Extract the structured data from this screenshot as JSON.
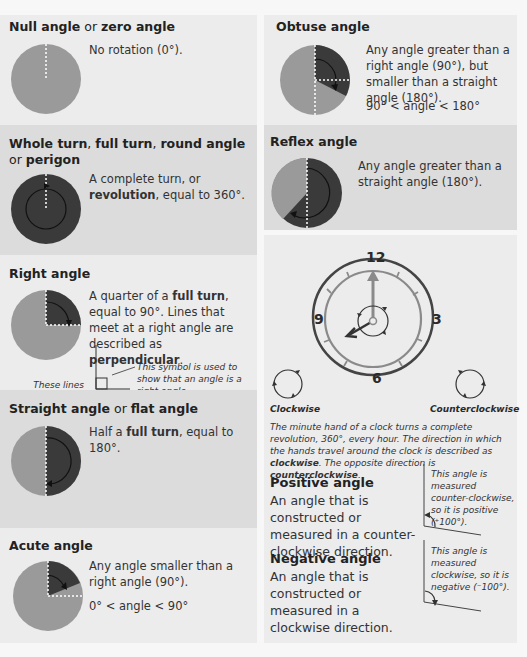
{
  "colors": {
    "light_panel": "#ececec",
    "dark_panel": "#dcdcdc",
    "pie_light": "#9a9a9a",
    "pie_dark": "#3a3a3a",
    "clock_outer": "#444444",
    "clock_inner": "#8a8a8a"
  },
  "null_angle": {
    "title_a": "Null angle",
    "title_or": " or ",
    "title_b": "zero angle",
    "desc": "No rotation (0°).",
    "icon": "null-angle-pie"
  },
  "whole_turn": {
    "title_a": "Whole turn",
    "sep1": ", ",
    "title_b": "full turn",
    "sep2": ", ",
    "title_c": "round angle",
    "title_or": "or ",
    "title_d": "perigon",
    "desc_1": "A complete turn, or",
    "desc_bold": "revolution",
    "desc_2": ", equal to 360°.",
    "icon": "whole-turn-pie"
  },
  "right_angle": {
    "title": "Right angle",
    "desc_1": "A quarter of a ",
    "desc_bold1": "full turn",
    "desc_2": ", equal to 90°. Lines that meet at a right angle are described as ",
    "desc_bold2": "perpendicular",
    "desc_3": ".",
    "note_left": "These lines are perpendicular.",
    "note_right": "This symbol is used to show that an angle is a right angle.",
    "icon": "right-angle-pie"
  },
  "straight_angle": {
    "title_a": "Straight angle",
    "title_or": " or ",
    "title_b": "flat angle",
    "desc_1": "Half a ",
    "desc_bold": "full turn",
    "desc_2": ", equal to 180°.",
    "icon": "straight-angle-pie"
  },
  "acute_angle": {
    "title": "Acute angle",
    "desc": "Any angle smaller than a right angle (90°).",
    "inequality": "0° < angle < 90°",
    "icon": "acute-angle-pie"
  },
  "obtuse_angle": {
    "title": "Obtuse angle",
    "desc": "Any angle greater than a right angle (90°), but smaller than a straight angle (180°).",
    "inequality": "90° < angle < 180°",
    "icon": "obtuse-angle-pie"
  },
  "reflex_angle": {
    "title": "Reflex angle",
    "desc": "Any angle greater than a straight angle (180°).",
    "icon": "reflex-angle-pie"
  },
  "clock": {
    "numbers": [
      "12",
      "3",
      "6",
      "9"
    ],
    "clockwise_label": "Clockwise",
    "counterclockwise_label": "Counterclockwise",
    "caption_1": "The minute hand of a clock turns a complete revolution, 360°, every hour. The direction in which the hands travel around the clock is described as ",
    "caption_bold1": "clockwise",
    "caption_2": ". The opposite direction is ",
    "caption_bold2": "counterclockwise",
    "caption_3": "."
  },
  "positive_angle": {
    "title": "Positive angle",
    "desc": "An angle that is constructed or measured in a counter-clockwise direction.",
    "note": "This angle is measured counter-clockwise, so it is positive (⁺100°)."
  },
  "negative_angle": {
    "title": "Negative angle",
    "desc": "An angle that is constructed or measured in a clockwise direction.",
    "note": "This angle is measured clockwise, so it is negative (⁻100°)."
  }
}
